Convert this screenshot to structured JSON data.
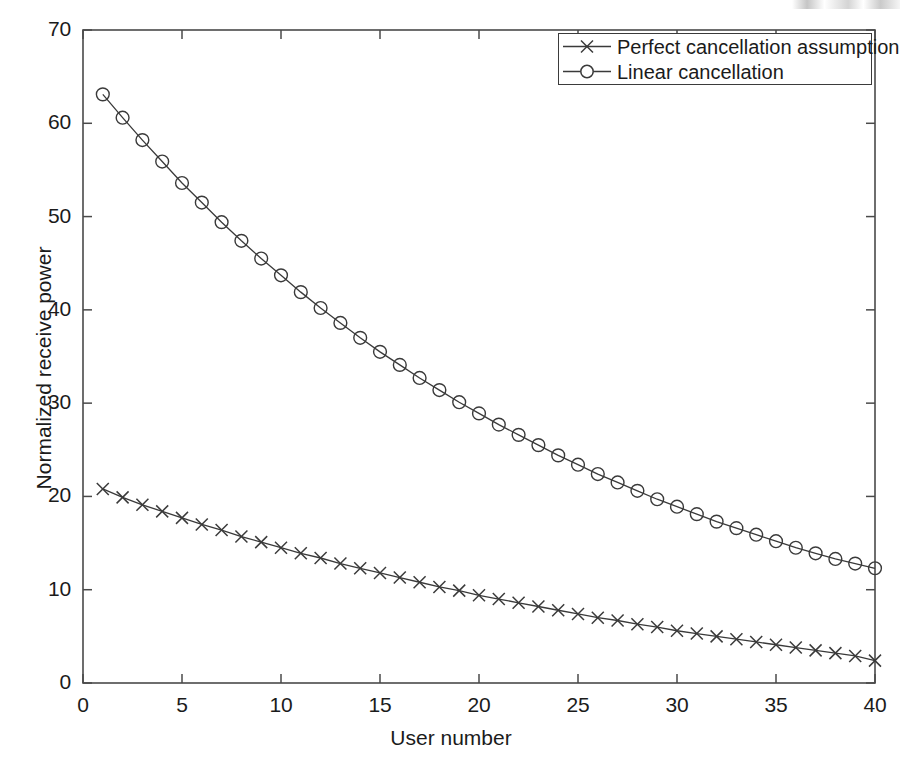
{
  "chart_data": {
    "type": "line",
    "title": "",
    "xlabel": "User number",
    "ylabel": "Normalized receive power",
    "xlim": [
      0,
      40
    ],
    "ylim": [
      0,
      70
    ],
    "xticks": [
      0,
      5,
      10,
      15,
      20,
      25,
      30,
      35,
      40
    ],
    "yticks": [
      0,
      10,
      20,
      30,
      40,
      50,
      60,
      70
    ],
    "grid": false,
    "legend_position": "top-right",
    "x": [
      1,
      2,
      3,
      4,
      5,
      6,
      7,
      8,
      9,
      10,
      11,
      12,
      13,
      14,
      15,
      16,
      17,
      18,
      19,
      20,
      21,
      22,
      23,
      24,
      25,
      26,
      27,
      28,
      29,
      30,
      31,
      32,
      33,
      34,
      35,
      36,
      37,
      38,
      39,
      40
    ],
    "series": [
      {
        "name": "Perfect cancellation assumption",
        "marker": "x",
        "color": "#3a3a3a",
        "values": [
          20.8,
          19.9,
          19.1,
          18.4,
          17.7,
          17.0,
          16.4,
          15.7,
          15.1,
          14.5,
          13.9,
          13.4,
          12.8,
          12.3,
          11.8,
          11.3,
          10.8,
          10.3,
          9.9,
          9.4,
          9.0,
          8.6,
          8.2,
          7.8,
          7.4,
          7.0,
          6.7,
          6.3,
          6.0,
          5.6,
          5.3,
          5.0,
          4.7,
          4.4,
          4.1,
          3.8,
          3.5,
          3.2,
          2.9,
          2.4
        ]
      },
      {
        "name": "Linear cancellation",
        "marker": "o",
        "color": "#3a3a3a",
        "values": [
          63.1,
          60.6,
          58.2,
          55.9,
          53.6,
          51.5,
          49.4,
          47.4,
          45.5,
          43.7,
          41.9,
          40.2,
          38.6,
          37.0,
          35.5,
          34.1,
          32.7,
          31.4,
          30.1,
          28.9,
          27.7,
          26.6,
          25.5,
          24.4,
          23.4,
          22.4,
          21.5,
          20.6,
          19.7,
          18.9,
          18.1,
          17.3,
          16.6,
          15.9,
          15.2,
          14.5,
          13.9,
          13.3,
          12.8,
          12.3
        ]
      }
    ]
  },
  "legend": {
    "entries": [
      {
        "label": "Perfect cancellation assumption",
        "marker": "x"
      },
      {
        "label": "Linear cancellation",
        "marker": "o"
      }
    ]
  },
  "axes": {
    "x_tick_labels": [
      "0",
      "5",
      "10",
      "15",
      "20",
      "25",
      "30",
      "35",
      "40"
    ],
    "y_tick_labels": [
      "0",
      "10",
      "20",
      "30",
      "40",
      "50",
      "60",
      "70"
    ],
    "x_axis_title": "User number",
    "y_axis_title": "Normalized receive power"
  }
}
